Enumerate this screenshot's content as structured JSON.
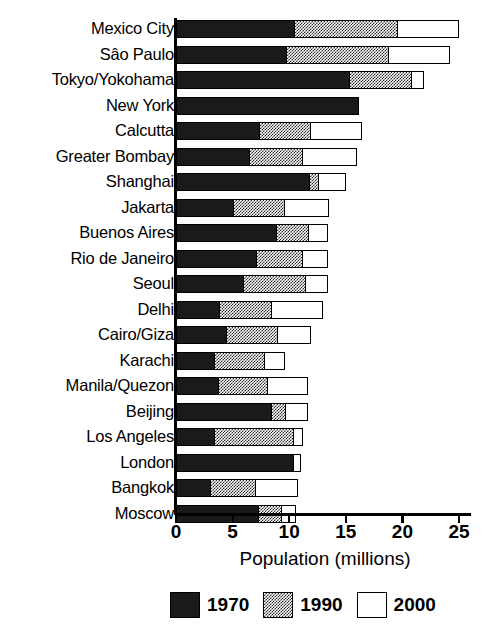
{
  "chart_data": {
    "type": "bar",
    "orientation": "horizontal",
    "stacked": true,
    "title": "",
    "xlabel": "Population (millions)",
    "ylabel": "",
    "xlim": [
      0,
      26.5
    ],
    "xticks": [
      0,
      5,
      10,
      15,
      20,
      25
    ],
    "xtick_labels": [
      "0",
      "5",
      "10",
      "15",
      "20",
      "25"
    ],
    "grid": false,
    "legend_position": "bottom",
    "categories": [
      "Mexico City",
      "Sâo Paulo",
      "Tokyo/Yokohama",
      "New York",
      "Calcutta",
      "Greater Bombay",
      "Shanghai",
      "Jakarta",
      "Buenos Aires",
      "Rio de Janeiro",
      "Seoul",
      "Delhi",
      "Cairo/Giza",
      "Karachi",
      "Manila/Quezon",
      "Beijing",
      "Los Angeles",
      "London",
      "Bangkok",
      "Moscow"
    ],
    "series": [
      {
        "name": "1970",
        "color": "#1a1a1a",
        "values": [
          10.4,
          9.7,
          15.3,
          16.2,
          7.3,
          6.4,
          11.8,
          5.0,
          8.9,
          7.1,
          5.9,
          3.8,
          4.4,
          3.3,
          3.7,
          8.4,
          3.3,
          10.4,
          3.0,
          7.3
        ]
      },
      {
        "name": "1990",
        "color": "#808080",
        "values": [
          9.2,
          9.1,
          5.5,
          0.0,
          4.6,
          4.8,
          0.8,
          4.6,
          2.8,
          4.1,
          5.6,
          4.6,
          4.6,
          4.5,
          4.4,
          1.3,
          7.1,
          0.0,
          4.0,
          2.0
        ]
      },
      {
        "name": "2000",
        "color": "#ffffff",
        "values": [
          5.4,
          5.4,
          1.1,
          0.0,
          4.5,
          4.8,
          2.4,
          3.9,
          1.7,
          2.2,
          1.9,
          4.6,
          2.9,
          1.8,
          3.6,
          2.0,
          0.8,
          0.6,
          3.8,
          1.3
        ]
      }
    ],
    "totals": [
      25.0,
      24.2,
      21.9,
      16.2,
      16.4,
      16.0,
      15.0,
      13.5,
      13.4,
      13.4,
      13.4,
      13.0,
      11.9,
      9.6,
      11.7,
      11.7,
      11.2,
      11.0,
      10.8,
      10.6
    ]
  },
  "legend": {
    "items": [
      {
        "label": "1970",
        "swatch": "solid-black"
      },
      {
        "label": "1990",
        "swatch": "checkered-gray"
      },
      {
        "label": "2000",
        "swatch": "white-outline"
      }
    ]
  },
  "colors": {
    "ink": "#000000",
    "bar_1970": "#1a1a1a",
    "bar_1990": "#808080",
    "bar_2000": "#ffffff",
    "background": "#ffffff"
  }
}
